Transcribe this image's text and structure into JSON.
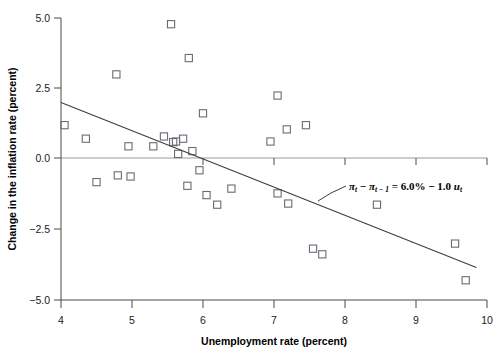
{
  "chart_data": {
    "type": "scatter",
    "title": "",
    "xlabel": "Unemployment rate (percent)",
    "ylabel": "Change in the inflation rate (percent)",
    "xlim": [
      4,
      10
    ],
    "ylim": [
      -5.0,
      5.0
    ],
    "xticks": [
      4,
      5,
      6,
      7,
      8,
      9,
      10
    ],
    "xticklabels": [
      "4",
      "5",
      "6",
      "7",
      "8",
      "9",
      "10"
    ],
    "yticks": [
      -5.0,
      -2.5,
      0.0,
      2.5,
      5.0
    ],
    "yticklabels": [
      "−5.0",
      "−2.5",
      "0.0",
      "2.5",
      "5.0"
    ],
    "grid": false,
    "zero_line": true,
    "legend": "none",
    "marker": "open-square",
    "marker_color": "#6b6b76",
    "line_color": "#3d3d3d",
    "points": [
      {
        "x": 4.05,
        "y": 1.2
      },
      {
        "x": 4.35,
        "y": 0.72
      },
      {
        "x": 4.5,
        "y": -0.82
      },
      {
        "x": 4.78,
        "y": 3.0
      },
      {
        "x": 4.8,
        "y": -0.58
      },
      {
        "x": 4.95,
        "y": 0.45
      },
      {
        "x": 4.98,
        "y": -0.62
      },
      {
        "x": 5.3,
        "y": 0.45
      },
      {
        "x": 5.45,
        "y": 0.8
      },
      {
        "x": 5.55,
        "y": 4.78
      },
      {
        "x": 5.58,
        "y": 0.6
      },
      {
        "x": 5.62,
        "y": 0.62
      },
      {
        "x": 5.65,
        "y": 0.18
      },
      {
        "x": 5.72,
        "y": 0.72
      },
      {
        "x": 5.78,
        "y": -0.95
      },
      {
        "x": 5.8,
        "y": 3.58
      },
      {
        "x": 5.85,
        "y": 0.28
      },
      {
        "x": 5.95,
        "y": -0.4
      },
      {
        "x": 6.0,
        "y": 1.62
      },
      {
        "x": 6.05,
        "y": -1.28
      },
      {
        "x": 6.2,
        "y": -1.62
      },
      {
        "x": 6.4,
        "y": -1.05
      },
      {
        "x": 6.95,
        "y": 0.62
      },
      {
        "x": 7.05,
        "y": 2.25
      },
      {
        "x": 7.05,
        "y": -1.22
      },
      {
        "x": 7.18,
        "y": 1.05
      },
      {
        "x": 7.2,
        "y": -1.58
      },
      {
        "x": 7.45,
        "y": 1.2
      },
      {
        "x": 7.55,
        "y": -3.18
      },
      {
        "x": 7.68,
        "y": -3.38
      },
      {
        "x": 8.45,
        "y": -1.62
      },
      {
        "x": 9.55,
        "y": -3.0
      },
      {
        "x": 9.7,
        "y": -4.3
      }
    ],
    "fit_line": {
      "intercept": 6.0,
      "slope": -1.0,
      "x_start": 4.0,
      "x_end": 9.85,
      "y_start": 2.0,
      "y_end": -3.85
    },
    "annotation": {
      "pi_t": "π",
      "sub_t": "t",
      "minus": "−",
      "sub_t_minus_1": "t − 1",
      "equals": "=",
      "intercept_text": "6.0%",
      "slope_text": "1.0",
      "u_symbol": "u",
      "full_text": "πt − πt−1 = 6.0% − 1.0 ut"
    }
  }
}
